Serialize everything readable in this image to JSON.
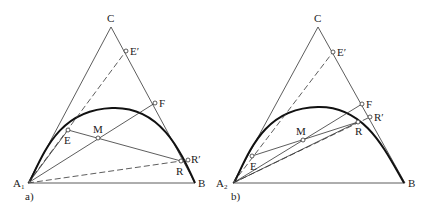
{
  "diagrams": [
    {
      "id": "a",
      "caption": "a)",
      "labels": {
        "A": "A",
        "A_sub": "1",
        "B": "B",
        "C": "C",
        "E": "E",
        "E_prime": "E′",
        "F": "F",
        "M": "M",
        "R": "R",
        "R_prime": "R′"
      }
    },
    {
      "id": "b",
      "caption": "b)",
      "labels": {
        "A": "A",
        "A_sub": "2",
        "B": "B",
        "C": "C",
        "E": "E",
        "E_prime": "E′",
        "F": "F",
        "M": "M",
        "R": "R",
        "R_prime": "R′"
      }
    }
  ],
  "colors": {
    "line": "#333333",
    "curve": "#111111",
    "background": "#ffffff"
  }
}
